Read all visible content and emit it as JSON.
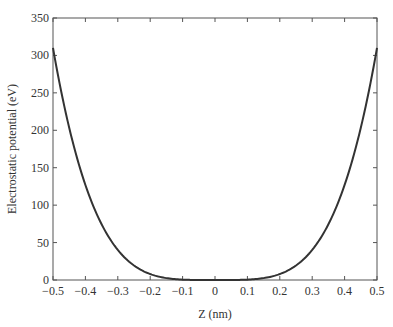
{
  "chart_data": {
    "type": "line",
    "title": "",
    "xlabel": "Z (nm)",
    "ylabel": "Electrostatic potential (eV)",
    "xlim": [
      -0.5,
      0.5
    ],
    "ylim": [
      0,
      350
    ],
    "xticks": [
      -0.5,
      -0.4,
      -0.3,
      -0.2,
      -0.1,
      0,
      0.1,
      0.2,
      0.3,
      0.4,
      0.5
    ],
    "xtick_labels": [
      "−0.5",
      "−0.4",
      "−0.3",
      "−0.2",
      "−0.1",
      "0",
      "0.1",
      "0.2",
      "0.3",
      "0.4",
      "0.5"
    ],
    "yticks": [
      0,
      50,
      100,
      150,
      200,
      250,
      300,
      350
    ],
    "ytick_labels": [
      "0",
      "50",
      "100",
      "150",
      "200",
      "250",
      "300",
      "350"
    ],
    "grid": false,
    "legend": null,
    "series": [
      {
        "name": "potential",
        "color": "#333333",
        "x": [
          -0.5,
          -0.45,
          -0.4,
          -0.35,
          -0.3,
          -0.25,
          -0.2,
          -0.15,
          -0.1,
          -0.05,
          0,
          0.05,
          0.1,
          0.15,
          0.2,
          0.25,
          0.3,
          0.35,
          0.4,
          0.45,
          0.5
        ],
        "y": [
          310,
          203,
          127,
          74,
          40,
          19,
          8,
          2.5,
          0.5,
          0,
          0,
          0,
          0.5,
          2.5,
          8,
          19,
          40,
          74,
          127,
          203,
          310
        ]
      }
    ]
  }
}
